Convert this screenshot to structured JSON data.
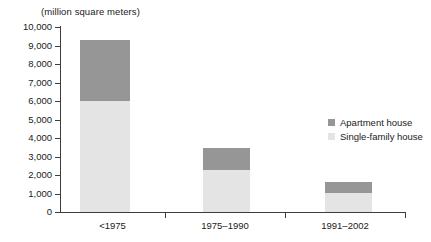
{
  "chart_data": {
    "type": "bar",
    "subtype": "stacked-vertical",
    "title": "(million square meters)",
    "xlabel": "",
    "ylabel": "",
    "ylim": [
      0,
      10000
    ],
    "ytick_step": 1000,
    "ytick_labels": [
      "10,000",
      "9,000",
      "8,000",
      "7,000",
      "6,000",
      "5,000",
      "4,000",
      "3,000",
      "2,000",
      "1,000",
      "0"
    ],
    "ytick_values": [
      10000,
      9000,
      8000,
      7000,
      6000,
      5000,
      4000,
      3000,
      2000,
      1000,
      0
    ],
    "categories": [
      "<1975",
      "1975–1990",
      "1991–2002"
    ],
    "grid": false,
    "legend_position": "right",
    "series": [
      {
        "name": "Single-family house",
        "color": "#e4e4e4",
        "values": [
          6000,
          2270,
          1000
        ]
      },
      {
        "name": "Apartment house",
        "color": "#969696",
        "values": [
          3300,
          1210,
          620
        ]
      }
    ],
    "totals": [
      9300,
      3480,
      1620
    ],
    "legend_order": [
      "Apartment house",
      "Single-family house"
    ]
  },
  "colors": {
    "apartment_house": "#969696",
    "single_family_house": "#e4e4e4",
    "axis": "#3d3d3d",
    "text": "#1a1a1a",
    "background": "#ffffff"
  }
}
